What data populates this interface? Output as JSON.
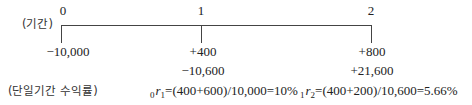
{
  "timeline": {
    "period_label": "(기간)",
    "periods": [
      {
        "label": "0",
        "cash_flow_1": "−10,000",
        "cash_flow_2": ""
      },
      {
        "label": "1",
        "cash_flow_1": "+400",
        "cash_flow_2": "−10,600"
      },
      {
        "label": "2",
        "cash_flow_1": "+800",
        "cash_flow_2": "+21,600"
      }
    ]
  },
  "returns": {
    "label": "(단일기간 수익률)",
    "r1": {
      "pre_sub": "0",
      "var": "r",
      "sub": "1",
      "expr": "=(400+600)/10,000=10%"
    },
    "r2": {
      "pre_sub": "1",
      "var": "r",
      "sub": "2",
      "expr": "=(400+200)/10,600=5.66%"
    }
  },
  "colors": {
    "line": "#444444",
    "text": "#222222"
  }
}
